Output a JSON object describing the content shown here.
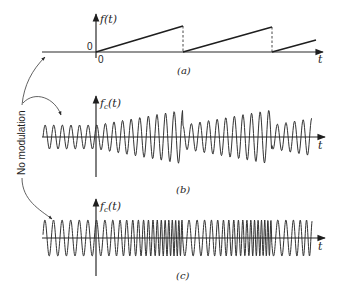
{
  "figure": {
    "side_label": "No modulation",
    "colors": {
      "ink": "#1e1e1e",
      "background": "#ffffff"
    },
    "panels": [
      {
        "id": "a",
        "caption": "(a)",
        "y_label_main": "f(t)",
        "y_label_sub": "",
        "y_label_tail": "",
        "x_label": "t",
        "origin_y_label": "0",
        "origin_x_label": "0",
        "signal": "sawtooth modulating signal"
      },
      {
        "id": "b",
        "caption": "(b)",
        "y_label_main": "f",
        "y_label_sub": "c",
        "y_label_tail": "(t)",
        "x_label": "t",
        "signal": "amplitude-modulated carrier"
      },
      {
        "id": "c",
        "caption": "(c)",
        "y_label_main": "f",
        "y_label_sub": "c",
        "y_label_tail": "(t)",
        "x_label": "t",
        "signal": "frequency-modulated carrier"
      }
    ]
  },
  "chart_data": [
    {
      "type": "line",
      "title": "(a)",
      "xlabel": "t",
      "ylabel": "f(t)",
      "description": "Sawtooth: zero for t<0, then linear ramps from 0 to peak, dropping back to 0 (dashed) each period",
      "x_px": [
        96,
        183,
        183,
        272,
        272,
        316
      ],
      "y_px": [
        52,
        26,
        52,
        27,
        52,
        40
      ],
      "periods_px": [
        [
          96,
          183
        ],
        [
          183,
          272
        ],
        [
          272,
          316
        ]
      ],
      "ylim": [
        0,
        1
      ]
    },
    {
      "type": "line",
      "title": "(b)",
      "xlabel": "t",
      "ylabel": "fc(t)",
      "description": "AM carrier: constant amplitude before t=0, amplitude follows sawtooth after",
      "carrier_period_px": 8.6,
      "wave_span_px": [
        43,
        312
      ],
      "axis_y_px": 137,
      "base_amplitude_px": 12,
      "peak_amplitude_px": 27
    },
    {
      "type": "line",
      "title": "(c)",
      "xlabel": "t",
      "ylabel": "fc(t)",
      "description": "FM carrier: constant frequency before t=0, frequency increases with sawtooth and resets each period",
      "carrier_period_px": 8.6,
      "min_period_px": 3,
      "wave_span_px": [
        43,
        312
      ],
      "axis_y_px": 238,
      "amplitude_px": 18
    }
  ]
}
